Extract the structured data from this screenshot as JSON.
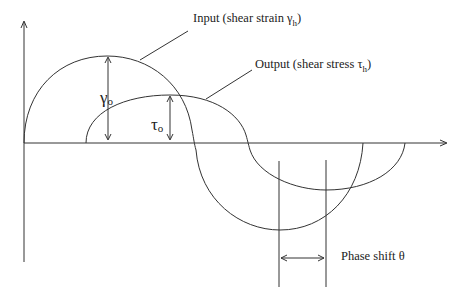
{
  "diagram": {
    "labels": {
      "input": "Input (shear strain γ",
      "input_sub": "h",
      "input_close": ")",
      "output": "Output (shear stress τ",
      "output_sub": "h",
      "output_close": ")",
      "gamma": "γ",
      "gamma_sub": "o",
      "tau": "τ",
      "tau_sub": "o",
      "phase": "Phase shift θ"
    },
    "colors": {
      "line": "#333333",
      "background": "#ffffff"
    },
    "curves": [
      {
        "name": "input-strain-curve",
        "amplitude": "γo",
        "description": "larger sinusoid starting at origin"
      },
      {
        "name": "output-stress-curve",
        "amplitude": "τo",
        "description": "smaller sinusoid shifted right by phase θ"
      }
    ]
  }
}
